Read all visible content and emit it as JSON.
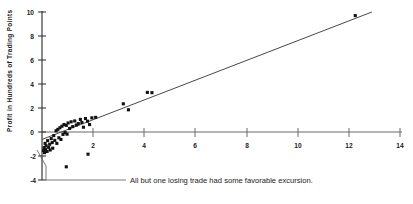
{
  "chart_data": {
    "type": "scatter",
    "title": "",
    "xlabel": "",
    "ylabel": "Profit in Hundreds of Trading Points",
    "xlim": [
      0,
      14
    ],
    "ylim": [
      -4,
      10
    ],
    "xticks": [
      2,
      4,
      6,
      8,
      10,
      12,
      14
    ],
    "xticklabels": [
      "2",
      "4",
      "6",
      "8",
      "10",
      "12",
      "14"
    ],
    "yticks": [
      -4,
      -2,
      0,
      2,
      4,
      6,
      8,
      10
    ],
    "yticklabels": [
      "-4",
      "-2",
      "0",
      "2",
      "4",
      "6",
      "8",
      "10"
    ],
    "grid": false,
    "legend": "none",
    "annotations": [
      {
        "name": "excursion-note",
        "text": "All but one losing trade had some favorable excursion.",
        "points_to_x": 0.95,
        "points_to_y": -2.9
      }
    ],
    "series": [
      {
        "name": "trades",
        "marker": "square",
        "color": "#111111",
        "points": [
          [
            0.06,
            -1.55
          ],
          [
            0.08,
            -1.3
          ],
          [
            0.1,
            -1.72
          ],
          [
            0.12,
            -0.95
          ],
          [
            0.14,
            -1.45
          ],
          [
            0.16,
            -1.15
          ],
          [
            0.2,
            -1.62
          ],
          [
            0.22,
            -0.72
          ],
          [
            0.26,
            -1.28
          ],
          [
            0.3,
            -1.02
          ],
          [
            0.32,
            -1.5
          ],
          [
            0.36,
            -0.55
          ],
          [
            0.4,
            -0.88
          ],
          [
            0.42,
            -1.35
          ],
          [
            0.46,
            -0.3
          ],
          [
            0.5,
            -0.7
          ],
          [
            0.55,
            0.1
          ],
          [
            0.58,
            -0.95
          ],
          [
            0.62,
            0.22
          ],
          [
            0.66,
            -0.48
          ],
          [
            0.7,
            0.35
          ],
          [
            0.74,
            -0.62
          ],
          [
            0.78,
            0.48
          ],
          [
            0.82,
            -0.2
          ],
          [
            0.86,
            0.62
          ],
          [
            0.9,
            -0.05
          ],
          [
            0.95,
            0.55
          ],
          [
            0.98,
            -0.18
          ],
          [
            1.02,
            0.75
          ],
          [
            1.08,
            0.3
          ],
          [
            1.14,
            0.85
          ],
          [
            1.2,
            0.45
          ],
          [
            1.28,
            0.92
          ],
          [
            1.34,
            0.58
          ],
          [
            1.42,
            0.7
          ],
          [
            1.5,
            1.05
          ],
          [
            1.56,
            0.8
          ],
          [
            1.62,
            0.4
          ],
          [
            1.7,
            1.12
          ],
          [
            1.78,
            0.9
          ],
          [
            1.86,
            0.62
          ],
          [
            1.95,
            1.18
          ],
          [
            2.1,
            1.22
          ],
          [
            3.18,
            2.35
          ],
          [
            3.38,
            1.85
          ],
          [
            4.12,
            3.3
          ],
          [
            4.3,
            3.28
          ],
          [
            12.25,
            9.7
          ],
          [
            1.8,
            -1.85
          ],
          [
            0.95,
            -2.9
          ]
        ]
      }
    ],
    "fit_line": {
      "name": "regression-line",
      "x0": 0.0,
      "y0": -0.62,
      "x1": 12.9,
      "y1": 10.0,
      "color": "#333333"
    }
  }
}
